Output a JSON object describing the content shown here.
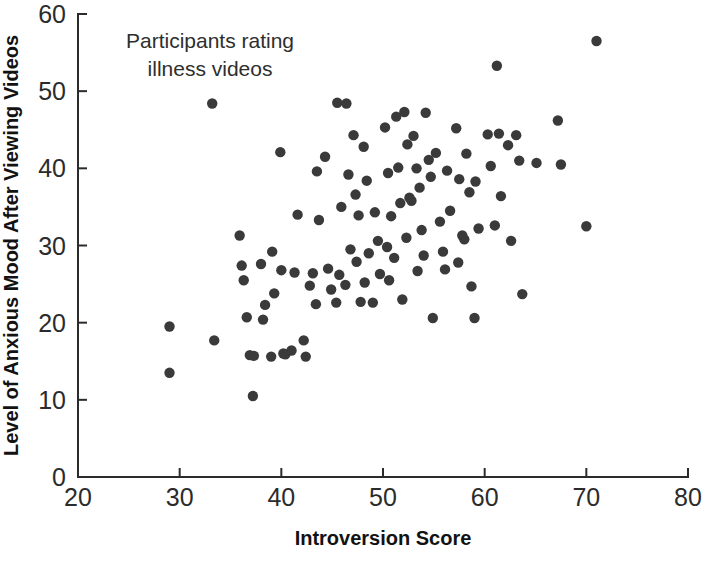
{
  "chart_data": {
    "type": "scatter",
    "title": "",
    "annotation": "Participants rating\nillness videos",
    "annotation_line1": "Participants rating",
    "annotation_line2": "illness videos",
    "xlabel": "Introversion Score",
    "ylabel": "Level of Anxious Mood After Viewing Videos",
    "xlim": [
      20,
      80
    ],
    "ylim": [
      0,
      60
    ],
    "xticks": [
      20,
      30,
      40,
      50,
      60,
      70,
      80
    ],
    "yticks": [
      0,
      10,
      20,
      30,
      40,
      50,
      60
    ],
    "xtick_labels": [
      "20",
      "30",
      "40",
      "50",
      "60",
      "70",
      "80"
    ],
    "ytick_labels": [
      "0",
      "10",
      "20",
      "30",
      "40",
      "50",
      "60"
    ],
    "grid": false,
    "legend": false,
    "marker_color": "#3a3a3a",
    "marker_size": 5.2,
    "n_points": 112,
    "points": [
      [
        29.0,
        19.5
      ],
      [
        29.0,
        13.5
      ],
      [
        33.2,
        48.4
      ],
      [
        33.4,
        17.7
      ],
      [
        35.9,
        31.3
      ],
      [
        36.1,
        27.4
      ],
      [
        36.3,
        25.5
      ],
      [
        36.6,
        20.7
      ],
      [
        36.9,
        15.8
      ],
      [
        37.3,
        15.7
      ],
      [
        37.2,
        10.5
      ],
      [
        38.0,
        27.6
      ],
      [
        38.4,
        22.3
      ],
      [
        38.2,
        20.4
      ],
      [
        39.1,
        29.2
      ],
      [
        39.3,
        23.8
      ],
      [
        39.0,
        15.6
      ],
      [
        39.9,
        42.1
      ],
      [
        40.0,
        26.8
      ],
      [
        40.2,
        16.0
      ],
      [
        40.4,
        15.9
      ],
      [
        41.0,
        16.4
      ],
      [
        41.3,
        26.5
      ],
      [
        41.6,
        34.0
      ],
      [
        42.2,
        17.7
      ],
      [
        42.4,
        15.6
      ],
      [
        42.8,
        24.8
      ],
      [
        43.1,
        26.4
      ],
      [
        43.4,
        22.4
      ],
      [
        43.7,
        33.3
      ],
      [
        43.5,
        39.6
      ],
      [
        44.3,
        41.5
      ],
      [
        44.6,
        27.0
      ],
      [
        44.9,
        24.3
      ],
      [
        45.5,
        48.5
      ],
      [
        45.9,
        35.0
      ],
      [
        45.7,
        26.2
      ],
      [
        45.4,
        22.6
      ],
      [
        46.4,
        48.4
      ],
      [
        46.6,
        39.2
      ],
      [
        46.8,
        29.5
      ],
      [
        46.3,
        24.9
      ],
      [
        47.1,
        44.3
      ],
      [
        47.3,
        36.6
      ],
      [
        47.6,
        33.9
      ],
      [
        47.4,
        27.9
      ],
      [
        47.8,
        22.7
      ],
      [
        48.1,
        42.8
      ],
      [
        48.4,
        38.4
      ],
      [
        48.6,
        29.0
      ],
      [
        48.2,
        25.2
      ],
      [
        49.2,
        34.3
      ],
      [
        49.5,
        30.6
      ],
      [
        49.7,
        26.3
      ],
      [
        49.0,
        22.6
      ],
      [
        50.2,
        45.3
      ],
      [
        50.5,
        39.4
      ],
      [
        50.8,
        33.8
      ],
      [
        50.4,
        29.8
      ],
      [
        50.6,
        25.5
      ],
      [
        51.3,
        46.7
      ],
      [
        51.5,
        40.1
      ],
      [
        51.7,
        35.5
      ],
      [
        51.1,
        28.4
      ],
      [
        51.9,
        23.0
      ],
      [
        52.1,
        47.3
      ],
      [
        52.4,
        43.1
      ],
      [
        52.6,
        36.2
      ],
      [
        52.8,
        35.8
      ],
      [
        52.3,
        31.0
      ],
      [
        53.0,
        44.2
      ],
      [
        53.3,
        40.0
      ],
      [
        53.6,
        37.5
      ],
      [
        53.8,
        32.0
      ],
      [
        53.4,
        26.7
      ],
      [
        54.2,
        47.2
      ],
      [
        54.5,
        41.1
      ],
      [
        54.7,
        38.9
      ],
      [
        54.0,
        28.7
      ],
      [
        54.9,
        20.6
      ],
      [
        55.2,
        42.0
      ],
      [
        55.6,
        33.1
      ],
      [
        55.9,
        29.2
      ],
      [
        56.3,
        39.7
      ],
      [
        56.6,
        34.5
      ],
      [
        56.1,
        26.9
      ],
      [
        57.2,
        45.2
      ],
      [
        57.5,
        38.6
      ],
      [
        57.8,
        31.3
      ],
      [
        57.4,
        27.8
      ],
      [
        58.2,
        41.9
      ],
      [
        58.5,
        36.9
      ],
      [
        58.0,
        30.8
      ],
      [
        58.7,
        24.7
      ],
      [
        59.1,
        38.3
      ],
      [
        59.4,
        32.2
      ],
      [
        59.0,
        20.6
      ],
      [
        60.3,
        44.4
      ],
      [
        60.6,
        40.3
      ],
      [
        61.2,
        53.3
      ],
      [
        61.4,
        44.5
      ],
      [
        61.6,
        36.4
      ],
      [
        61.0,
        32.6
      ],
      [
        62.3,
        43.0
      ],
      [
        62.6,
        30.6
      ],
      [
        63.1,
        44.3
      ],
      [
        63.4,
        41.0
      ],
      [
        63.7,
        23.7
      ],
      [
        65.1,
        40.7
      ],
      [
        67.2,
        46.2
      ],
      [
        67.5,
        40.5
      ],
      [
        70.0,
        32.5
      ],
      [
        71.0,
        56.5
      ]
    ]
  }
}
